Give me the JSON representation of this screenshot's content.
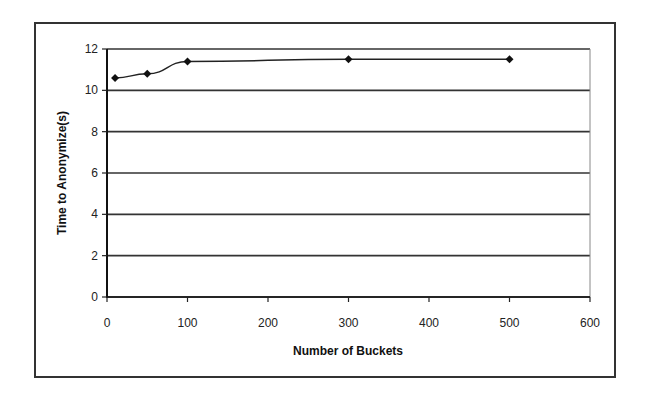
{
  "chart_data": {
    "type": "line",
    "title": "",
    "xlabel": "Number of Buckets",
    "ylabel": "Time to Anonymize(s)",
    "x": [
      10,
      50,
      100,
      300,
      500
    ],
    "series": [
      {
        "name": "Time to Anonymize",
        "values": [
          10.6,
          10.8,
          11.4,
          11.5,
          11.5
        ]
      }
    ],
    "xlim": [
      0,
      600
    ],
    "ylim": [
      0,
      12
    ],
    "xticks": [
      "0",
      "100",
      "200",
      "300",
      "400",
      "500",
      "600"
    ],
    "yticks": [
      "0",
      "2",
      "4",
      "6",
      "8",
      "10",
      "12"
    ],
    "grid": {
      "horizontal": true,
      "vertical": false
    },
    "legend": null,
    "colors": {
      "line": "#222222",
      "marker": "#111111",
      "grid": "#333333"
    }
  }
}
